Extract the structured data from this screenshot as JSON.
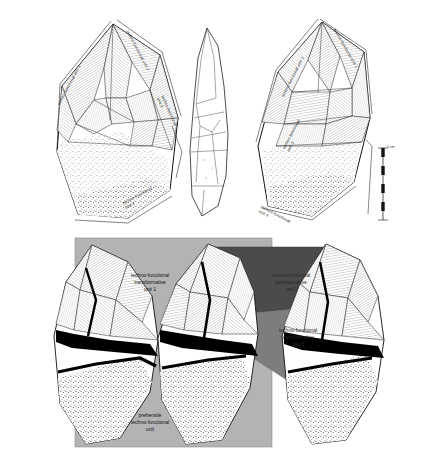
{
  "figure": {
    "upper_panel": {
      "name": "upper-artifact-row",
      "artifacts": [
        {
          "id": "left-artifact",
          "view": "dorsal face, shaded"
        },
        {
          "id": "middle-artifact",
          "view": "profile outline"
        },
        {
          "id": "right-artifact",
          "view": "ventral face, shaded"
        }
      ],
      "labels": [
        {
          "key": "l1",
          "text": "techno-functional unit 1",
          "x": 57,
          "y": 104,
          "rot": -62
        },
        {
          "key": "l2",
          "text": "techno-functional unit 2",
          "x": 129,
          "y": 30,
          "rot": 62
        },
        {
          "key": "l3",
          "text": "techno-functional\nunit 3",
          "x": 164,
          "y": 95,
          "rot": 66
        },
        {
          "key": "l4",
          "text": "techno-functional\nunit 4",
          "x": 122,
          "y": 202,
          "rot": -28
        },
        {
          "key": "r3",
          "text": "techno-functional\nunit 3",
          "x": 282,
          "y": 148,
          "rot": -62
        },
        {
          "key": "r2",
          "text": "techno-functional unit 2",
          "x": 281,
          "y": 96,
          "rot": -63
        },
        {
          "key": "r1",
          "text": "techno-functional unit 1",
          "x": 336,
          "y": 28,
          "rot": 60
        },
        {
          "key": "r4",
          "text": "techno-functional\nunit 4",
          "x": 262,
          "y": 205,
          "rot": 28
        }
      ],
      "scale_bar": {
        "label": "1 cm",
        "x": 376,
        "y": 148,
        "height": 72
      }
    },
    "lower_panel": {
      "name": "lower-artifact-row",
      "background_color": "#b3b3b3",
      "unit2_color": "#4b4b4b",
      "unit3_color": "#7d7d7d",
      "labels": [
        {
          "key": "u1",
          "text": "techno-functional\ntransformative\nunit 1",
          "x": 112,
          "y": 272,
          "dark": false
        },
        {
          "key": "u2",
          "text": "techno-functional\ntransformative\nunit 2",
          "x": 255,
          "y": 272,
          "dark": true
        },
        {
          "key": "u3",
          "text": "techno-functional\ntransformative\nunit 3",
          "x": 265,
          "y": 327,
          "dark": true
        },
        {
          "key": "pu",
          "text": "prehensile\ntechno-functional\nunit",
          "x": 112,
          "y": 412,
          "dark": false
        }
      ]
    }
  }
}
